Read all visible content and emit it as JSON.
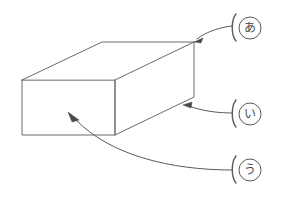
{
  "figure": {
    "background_color": "#ffffff",
    "line_color": "#6b6b6b",
    "leader_color": "#5a5a5a",
    "arrow_color": "#4a4a4a",
    "width": 282,
    "height": 199
  },
  "object": {
    "name": "rectangular-box",
    "shape": "cuboid",
    "vertices": {
      "front_top_left": [
        22,
        80
      ],
      "front_top_right": [
        115,
        80
      ],
      "front_bottom_left": [
        22,
        135
      ],
      "front_bottom_right": [
        115,
        135
      ],
      "back_top_left": [
        102,
        42
      ],
      "back_top_right": [
        194,
        42
      ],
      "back_bottom_right": [
        194,
        97
      ]
    },
    "faces": [
      {
        "name": "front-face",
        "label_ref": "u"
      },
      {
        "name": "top-face",
        "label_ref": "a"
      },
      {
        "name": "right-face",
        "label_ref": "i"
      }
    ]
  },
  "labels": [
    {
      "id": "a",
      "kana": "あ",
      "romaji": "a",
      "bracket": "(",
      "position": [
        249,
        28
      ],
      "target": [
        194,
        42
      ],
      "target_description": "back-top-right-vertex"
    },
    {
      "id": "i",
      "kana": "い",
      "romaji": "i",
      "bracket": "(",
      "position": [
        249,
        114
      ],
      "target": [
        184,
        105
      ],
      "target_description": "right-face-lower-edge"
    },
    {
      "id": "u",
      "kana": "う",
      "romaji": "u",
      "bracket": "(",
      "position": [
        249,
        170
      ],
      "target": [
        68,
        112
      ],
      "target_description": "front-face"
    }
  ]
}
